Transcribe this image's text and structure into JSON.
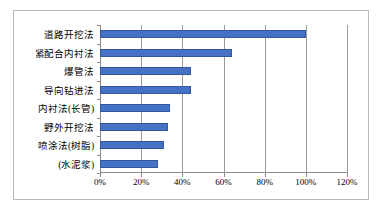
{
  "chart_data": {
    "type": "bar",
    "orientation": "horizontal",
    "title": "",
    "xlabel": "",
    "ylabel": "",
    "xlim": [
      0,
      120
    ],
    "xtick_labels": [
      "0%",
      "20%",
      "40%",
      "60%",
      "80%",
      "100%",
      "120%"
    ],
    "xtick_values": [
      0,
      20,
      40,
      60,
      80,
      100,
      120
    ],
    "grid": true,
    "legend": false,
    "bar_color": "#4572C4",
    "categories": [
      "道路开挖法",
      "紧配合内衬法",
      "爆管法",
      "导向钻进法",
      "内衬法(长管)",
      "野外开挖法",
      "喷涂法(树脂)",
      "(水泥浆)"
    ],
    "values": [
      100,
      64,
      44,
      44,
      34,
      33,
      31,
      28
    ],
    "series": [
      {
        "name": "",
        "values": [
          100,
          64,
          44,
          44,
          34,
          33,
          31,
          28
        ]
      }
    ]
  }
}
